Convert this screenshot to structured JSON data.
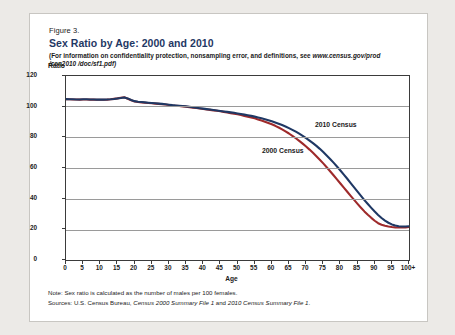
{
  "figure": {
    "number": "Figure 3.",
    "title": "Sex Ratio by Age: 2000 and 2010",
    "subtitle_line1": "(For information on confidentiality protection, nonsampling error, and definitions, see ",
    "subtitle_url": "www.census.gov/prod",
    "subtitle_line2": "/cen2010 /doc/sf1.pdf)",
    "note": "Note: Sex ratio is calculated as the number of males per 100 females.",
    "sources_prefix": "Sources: U.S. Census Bureau, ",
    "sources_italic1": "Census 2000 Summary File 1",
    "sources_mid": " and ",
    "sources_italic2": "2010 Census Summary File 1",
    "sources_end": "."
  },
  "colors": {
    "title": "#1f3864",
    "census2010": "#1f3864",
    "census2000": "#9e2a2b",
    "grid": "#9a9a9a",
    "axis": "#3b3b3b",
    "panel": "#ffffff",
    "page": "#eceae7"
  },
  "chart_data": {
    "type": "line",
    "title": "Sex Ratio by Age: 2000 and 2010",
    "xlabel": "Age",
    "ylabel": "Ratio",
    "ylim": [
      0,
      120
    ],
    "xlim": [
      0,
      100
    ],
    "yticks": [
      0,
      20,
      40,
      60,
      80,
      100,
      120
    ],
    "xticks": [
      "0",
      "5",
      "10",
      "15",
      "20",
      "25",
      "30",
      "35",
      "40",
      "45",
      "50",
      "55",
      "60",
      "65",
      "70",
      "75",
      "80",
      "85",
      "90",
      "95",
      "100+"
    ],
    "grid": true,
    "legend": "inline-annotations",
    "x": [
      0,
      1,
      2,
      3,
      4,
      5,
      6,
      7,
      8,
      9,
      10,
      11,
      12,
      13,
      14,
      15,
      16,
      17,
      18,
      19,
      20,
      21,
      22,
      23,
      24,
      25,
      26,
      27,
      28,
      29,
      30,
      31,
      32,
      33,
      34,
      35,
      36,
      37,
      38,
      39,
      40,
      41,
      42,
      43,
      44,
      45,
      46,
      47,
      48,
      49,
      50,
      51,
      52,
      53,
      54,
      55,
      56,
      57,
      58,
      59,
      60,
      61,
      62,
      63,
      64,
      65,
      66,
      67,
      68,
      69,
      70,
      71,
      72,
      73,
      74,
      75,
      76,
      77,
      78,
      79,
      80,
      81,
      82,
      83,
      84,
      85,
      86,
      87,
      88,
      89,
      90,
      91,
      92,
      93,
      94,
      95,
      96,
      97,
      98,
      99,
      100
    ],
    "series": [
      {
        "name": "2010 Census",
        "color": "#1f3864",
        "values": [
          104.9,
          104.8,
          104.8,
          104.7,
          104.7,
          104.8,
          104.8,
          104.7,
          104.7,
          104.6,
          104.6,
          104.6,
          104.7,
          104.8,
          105.0,
          105.3,
          105.6,
          106.0,
          105.4,
          104.4,
          103.6,
          103.2,
          103.0,
          102.8,
          102.6,
          102.4,
          102.2,
          102.0,
          101.8,
          101.6,
          101.3,
          101.0,
          100.8,
          100.6,
          100.4,
          100.2,
          99.9,
          99.6,
          99.3,
          99.0,
          98.7,
          98.4,
          98.1,
          97.8,
          97.5,
          97.2,
          96.9,
          96.6,
          96.3,
          96.0,
          95.6,
          95.2,
          94.8,
          94.4,
          94.0,
          93.5,
          93.0,
          92.4,
          91.8,
          91.2,
          90.5,
          89.7,
          88.9,
          88.0,
          87.1,
          86.0,
          84.9,
          83.7,
          82.4,
          81.0,
          79.5,
          77.9,
          76.2,
          74.4,
          72.5,
          70.4,
          68.2,
          65.9,
          63.5,
          61.0,
          58.4,
          55.7,
          53.0,
          50.2,
          47.4,
          44.6,
          41.8,
          39.1,
          36.5,
          34.0,
          31.6,
          29.4,
          27.4,
          25.7,
          24.3,
          23.2,
          22.5,
          22.0,
          21.8,
          21.8,
          22.0
        ]
      },
      {
        "name": "2000 Census",
        "color": "#9e2a2b",
        "values": [
          104.8,
          104.8,
          104.7,
          104.7,
          104.6,
          104.7,
          104.7,
          104.6,
          104.6,
          104.5,
          104.5,
          104.5,
          104.6,
          104.8,
          105.1,
          105.4,
          105.8,
          106.1,
          105.2,
          104.2,
          103.4,
          103.0,
          102.8,
          102.6,
          102.4,
          102.2,
          102.0,
          101.8,
          101.6,
          101.4,
          101.1,
          100.8,
          100.6,
          100.4,
          100.2,
          100.0,
          99.7,
          99.4,
          99.1,
          98.8,
          98.5,
          98.2,
          97.9,
          97.6,
          97.3,
          97.0,
          96.6,
          96.2,
          95.8,
          95.4,
          95.0,
          94.5,
          94.0,
          93.5,
          93.0,
          92.4,
          91.7,
          91.0,
          90.2,
          89.4,
          88.5,
          87.5,
          86.4,
          85.2,
          83.9,
          82.5,
          81.0,
          79.4,
          77.7,
          75.9,
          74.0,
          72.0,
          69.9,
          67.7,
          65.4,
          63.0,
          60.5,
          57.9,
          55.3,
          52.6,
          49.9,
          47.2,
          44.5,
          41.8,
          39.2,
          36.6,
          34.1,
          31.7,
          29.5,
          27.5,
          25.6,
          24.0,
          23.0,
          22.3,
          21.8,
          21.5,
          21.3,
          21.2,
          21.2,
          21.3,
          21.5
        ]
      }
    ]
  }
}
